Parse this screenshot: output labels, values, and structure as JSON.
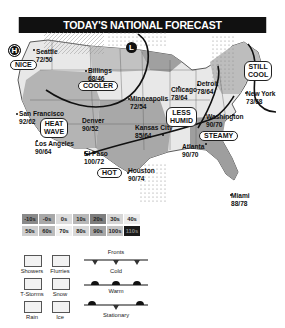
{
  "header": {
    "title": "TODAY'S NATIONAL FORECAST"
  },
  "pressure_systems": [
    {
      "type": "high",
      "symbol": "H"
    },
    {
      "type": "low",
      "symbol": "L"
    }
  ],
  "cities": [
    {
      "name": "Seattle",
      "temp": "72/50"
    },
    {
      "name": "Billings",
      "temp": "68/46"
    },
    {
      "name": "Minneapolis",
      "temp": "72/54"
    },
    {
      "name": "Chicago",
      "temp": "78/64"
    },
    {
      "name": "Detroit",
      "temp": "78/64"
    },
    {
      "name": "New York",
      "temp": "73/68"
    },
    {
      "name": "San Francisco",
      "temp": "92/62"
    },
    {
      "name": "Denver",
      "temp": "90/52"
    },
    {
      "name": "Kansas City",
      "temp": "85/64"
    },
    {
      "name": "Washington",
      "temp": "90/70"
    },
    {
      "name": "Los Angeles",
      "temp": "90/64"
    },
    {
      "name": "El Paso",
      "temp": "100/72"
    },
    {
      "name": "Atlanta",
      "temp": "90/70"
    },
    {
      "name": "Houston",
      "temp": "90/74"
    },
    {
      "name": "Miami",
      "temp": "88/78"
    }
  ],
  "callouts": [
    {
      "id": "nice",
      "text": "NICE"
    },
    {
      "id": "cooler",
      "text": "COOLER"
    },
    {
      "id": "still-cool",
      "line1": "STILL",
      "line2": "COOL"
    },
    {
      "id": "less-humid",
      "line1": "LESS",
      "line2": "HUMID"
    },
    {
      "id": "heat-wave",
      "line1": "HEAT",
      "line2": "WAVE"
    },
    {
      "id": "steamy",
      "text": "STEAMY"
    },
    {
      "id": "hot",
      "text": "HOT"
    }
  ],
  "legend": {
    "temperature_bands": [
      {
        "label": "-10s",
        "color": "#8a8a8a"
      },
      {
        "label": "-0s",
        "color": "#a8a8a8"
      },
      {
        "label": "0s",
        "color": "#dcdcdc"
      },
      {
        "label": "10s",
        "color": "#b8b8b8"
      },
      {
        "label": "20s",
        "color": "#7e7e7e"
      },
      {
        "label": "30s",
        "color": "#d6d6d6"
      },
      {
        "label": "40s",
        "color": "#ececec"
      },
      {
        "label": "50s",
        "color": "#cfcfcf"
      },
      {
        "label": "60s",
        "color": "#bcbcbc"
      },
      {
        "label": "70s",
        "color": "#f0f0f0"
      },
      {
        "label": "80s",
        "color": "#d8d8d8"
      },
      {
        "label": "90s",
        "color": "#a6a6a6"
      },
      {
        "label": "100s",
        "color": "#c4c4c4"
      },
      {
        "label": "110s",
        "color": "#1a1a1a"
      }
    ],
    "precipitation": [
      {
        "label": "Showers"
      },
      {
        "label": "Flurries"
      },
      {
        "label": "T-Storms"
      },
      {
        "label": "Snow"
      },
      {
        "label": "Rain"
      },
      {
        "label": "Ice"
      }
    ],
    "fronts_title": "Fronts",
    "fronts": [
      {
        "label": "Cold"
      },
      {
        "label": "Warm"
      },
      {
        "label": "Stationary"
      }
    ]
  }
}
